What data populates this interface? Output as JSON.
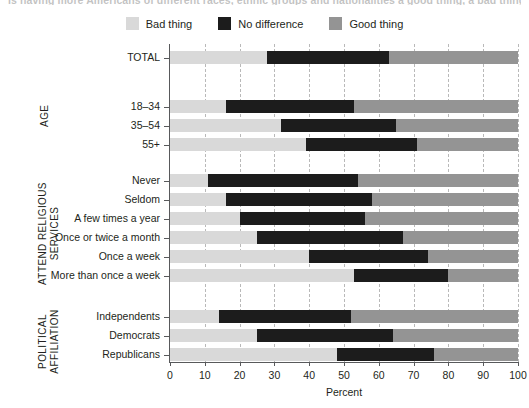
{
  "title_sliver": "Is having more Americans of different races, ethnic groups and nationalities a good thing, a bad thing or doesn't make much difference?",
  "legend": {
    "items": [
      {
        "label": "Bad thing",
        "color": "#d9d9d9",
        "key": "bad"
      },
      {
        "label": "No difference",
        "color": "#1c1c1c",
        "key": "same"
      },
      {
        "label": "Good thing",
        "color": "#949494",
        "key": "good"
      }
    ]
  },
  "groups": [
    {
      "name": "",
      "label": ""
    },
    {
      "name": "age",
      "label": "AGE"
    },
    {
      "name": "attend-religious-services",
      "label": "ATTEND RELIGIOUS\nSERVICES"
    },
    {
      "name": "political-affiliation",
      "label": "POLITICAL\nAFFILIATION"
    }
  ],
  "axis": {
    "x_title": "Percent",
    "x_min": 0,
    "x_max": 100,
    "x_ticks": [
      0,
      10,
      20,
      30,
      40,
      50,
      60,
      70,
      80,
      90,
      100
    ],
    "x_tick_labels": [
      "0",
      "10",
      "20",
      "30",
      "40",
      "50",
      "60",
      "70",
      "80",
      "90",
      "100"
    ]
  },
  "chart_data": {
    "type": "bar",
    "orientation": "horizontal",
    "stacked": true,
    "stacked_100": true,
    "title": "Is having more Americans of different races, ethnic groups and nationalities a good thing, a bad thing or doesn't make much difference?",
    "xlabel": "Percent",
    "ylabel": "",
    "xlim": [
      0,
      100
    ],
    "grid": "vertical-dashed",
    "legend_position": "top-center",
    "series": [
      {
        "name": "Bad thing",
        "color": "#d9d9d9",
        "values": [
          28,
          16,
          32,
          39,
          11,
          16,
          20,
          25,
          40,
          53,
          14,
          25,
          48
        ]
      },
      {
        "name": "No difference",
        "color": "#1c1c1c",
        "values": [
          35,
          37,
          33,
          32,
          43,
          42,
          36,
          42,
          34,
          27,
          38,
          39,
          28
        ]
      },
      {
        "name": "Good thing",
        "color": "#949494",
        "values": [
          37,
          47,
          35,
          29,
          46,
          42,
          44,
          33,
          26,
          20,
          48,
          36,
          24
        ]
      }
    ],
    "categories": [
      "TOTAL",
      "18–34",
      "35–54",
      "55+",
      "Never",
      "Seldom",
      "A few times a year",
      "Once or twice a month",
      "Once a week",
      "More than once a week",
      "Independents",
      "Democrats",
      "Republicans"
    ],
    "category_groups": [
      "",
      "AGE",
      "AGE",
      "AGE",
      "ATTEND RELIGIOUS SERVICES",
      "ATTEND RELIGIOUS SERVICES",
      "ATTEND RELIGIOUS SERVICES",
      "ATTEND RELIGIOUS SERVICES",
      "ATTEND RELIGIOUS SERVICES",
      "ATTEND RELIGIOUS SERVICES",
      "POLITICAL AFFILIATION",
      "POLITICAL AFFILIATION",
      "POLITICAL AFFILIATION"
    ]
  },
  "rows": [
    {
      "name": "total",
      "label": "TOTAL",
      "y": 51,
      "bad": 28,
      "same": 35,
      "good": 37
    },
    {
      "name": "age-18-34",
      "label": "18–34",
      "y": 100,
      "bad": 16,
      "same": 37,
      "good": 47
    },
    {
      "name": "age-35-54",
      "label": "35–54",
      "y": 119,
      "bad": 32,
      "same": 33,
      "good": 35
    },
    {
      "name": "age-55-plus",
      "label": "55+",
      "y": 138,
      "bad": 39,
      "same": 32,
      "good": 29
    },
    {
      "name": "attend-never",
      "label": "Never",
      "y": 174,
      "bad": 11,
      "same": 43,
      "good": 46
    },
    {
      "name": "attend-seldom",
      "label": "Seldom",
      "y": 193,
      "bad": 16,
      "same": 42,
      "good": 42
    },
    {
      "name": "attend-few-times-year",
      "label": "A few times a year",
      "y": 212,
      "bad": 20,
      "same": 36,
      "good": 44
    },
    {
      "name": "attend-once-twice-month",
      "label": "Once or twice a month",
      "y": 231,
      "bad": 25,
      "same": 42,
      "good": 33
    },
    {
      "name": "attend-once-week",
      "label": "Once a week",
      "y": 250,
      "bad": 40,
      "same": 34,
      "good": 26
    },
    {
      "name": "attend-more-than-week",
      "label": "More than once a week",
      "y": 269,
      "bad": 53,
      "same": 27,
      "good": 20
    },
    {
      "name": "independents",
      "label": "Independents",
      "y": 310,
      "bad": 14,
      "same": 38,
      "good": 48
    },
    {
      "name": "democrats",
      "label": "Democrats",
      "y": 329,
      "bad": 25,
      "same": 39,
      "good": 36
    },
    {
      "name": "republicans",
      "label": "Republicans",
      "y": 348,
      "bad": 48,
      "same": 28,
      "good": 24
    }
  ]
}
